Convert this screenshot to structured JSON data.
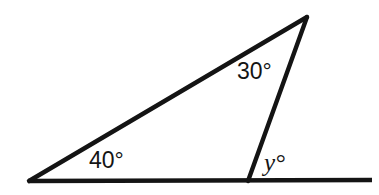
{
  "figure": {
    "kind": "geometry-diagram",
    "shape": "triangle-with-extended-base",
    "background_color": "#ffffff",
    "stroke_color": "#141414",
    "stroke_width": 4
  },
  "labels": {
    "angle_a": "40°",
    "angle_b": "30°",
    "angle_y": "y°"
  },
  "chart_data": {
    "type": "diagram",
    "title": "",
    "points": {
      "left_vertex": [
        29,
        181
      ],
      "apex": [
        307,
        17
      ],
      "base_right_vertex": [
        248,
        181
      ],
      "base_line_start": [
        28,
        181
      ],
      "base_line_end": [
        372,
        180
      ]
    },
    "segments": [
      {
        "name": "base-line",
        "from": "base_line_start",
        "to": "base_line_end"
      },
      {
        "name": "hypotenuse",
        "from": "left_vertex",
        "to": "apex"
      },
      {
        "name": "right-leg",
        "from": "apex",
        "to": "base_right_vertex"
      }
    ],
    "angles": [
      {
        "name": "angle-at-left-vertex",
        "vertex": "left_vertex",
        "value": 40,
        "unit": "degrees",
        "label": "40°",
        "known": true
      },
      {
        "name": "angle-at-apex",
        "vertex": "apex",
        "value": 30,
        "unit": "degrees",
        "label": "30°",
        "known": true
      },
      {
        "name": "exterior-angle-at-base-right-vertex",
        "vertex": "base_right_vertex",
        "value": null,
        "unit": "degrees",
        "label": "y°",
        "known": false
      }
    ]
  }
}
